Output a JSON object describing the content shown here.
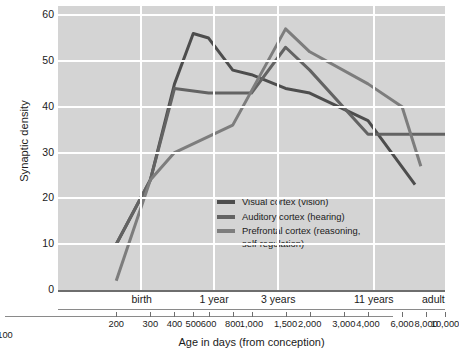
{
  "chart_data": {
    "type": "line",
    "title": "",
    "xlabel": "Age in days (from conception)",
    "ylabel": "Synaptic density",
    "xscale": "log",
    "xlim": [
      100,
      10000
    ],
    "ylim": [
      0,
      62
    ],
    "yticks": [
      0,
      10,
      20,
      30,
      40,
      50,
      60
    ],
    "xticks": [
      100,
      200,
      300,
      400,
      500,
      600,
      800,
      1000,
      1500,
      2000,
      3000,
      4000,
      6000,
      8000,
      10000
    ],
    "xtick_labels": [
      "100",
      "200",
      "300",
      "400",
      "500",
      "600",
      "800",
      "1,000",
      "1,500",
      "2,000",
      "3,000",
      "4,000",
      "6,000",
      "8,000",
      "10,000"
    ],
    "grid": true,
    "legend_position": "center-left",
    "stage_markers": [
      {
        "label": "birth",
        "x": 270
      },
      {
        "label": "1 year",
        "x": 640
      },
      {
        "label": "3 years",
        "x": 1370
      },
      {
        "label": "11 years",
        "x": 4300
      },
      {
        "label": "adult",
        "x": 9600
      }
    ],
    "series": [
      {
        "name": "Visual cortex (vision)",
        "color": "#4d4d4d",
        "points": [
          {
            "x": 200,
            "y": 10
          },
          {
            "x": 300,
            "y": 24
          },
          {
            "x": 400,
            "y": 45
          },
          {
            "x": 500,
            "y": 56
          },
          {
            "x": 600,
            "y": 55
          },
          {
            "x": 800,
            "y": 48
          },
          {
            "x": 1000,
            "y": 47
          },
          {
            "x": 1500,
            "y": 44
          },
          {
            "x": 2000,
            "y": 43
          },
          {
            "x": 4000,
            "y": 37
          },
          {
            "x": 7000,
            "y": 23
          }
        ]
      },
      {
        "name": "Auditory cortex (hearing)",
        "color": "#636363",
        "points": [
          {
            "x": 200,
            "y": 10
          },
          {
            "x": 300,
            "y": 24
          },
          {
            "x": 400,
            "y": 44
          },
          {
            "x": 600,
            "y": 43
          },
          {
            "x": 1000,
            "y": 43
          },
          {
            "x": 1500,
            "y": 53
          },
          {
            "x": 2000,
            "y": 48
          },
          {
            "x": 4000,
            "y": 34
          },
          {
            "x": 6000,
            "y": 34
          },
          {
            "x": 10000,
            "y": 34
          }
        ]
      },
      {
        "name": "Prefrontal cortex (reasoning,\nself-regulation)",
        "color": "#7d7d7d",
        "points": [
          {
            "x": 200,
            "y": 2
          },
          {
            "x": 300,
            "y": 24
          },
          {
            "x": 400,
            "y": 30
          },
          {
            "x": 800,
            "y": 36
          },
          {
            "x": 1500,
            "y": 57
          },
          {
            "x": 2000,
            "y": 52
          },
          {
            "x": 4000,
            "y": 45
          },
          {
            "x": 6000,
            "y": 40
          },
          {
            "x": 7500,
            "y": 27
          }
        ]
      }
    ]
  },
  "legend": {
    "items": [
      {
        "label": "Visual cortex (vision)"
      },
      {
        "label": "Auditory cortex (hearing)"
      },
      {
        "label": "Prefrontal cortex (reasoning,\nself-regulation)"
      }
    ]
  }
}
